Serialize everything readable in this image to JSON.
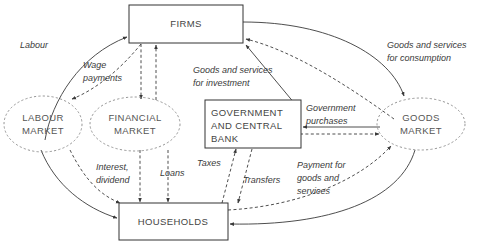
{
  "diagram": {
    "nodes": {
      "firms": {
        "label": "FIRMS",
        "shape": "rectangle"
      },
      "households": {
        "label": "HOUSEHOLDS",
        "shape": "rectangle"
      },
      "government": {
        "label_line1": "GOVERNMENT",
        "label_line2": "AND CENTRAL",
        "label_line3": "BANK",
        "shape": "rectangle"
      },
      "labour_market": {
        "label_line1": "LABOUR",
        "label_line2": "MARKET",
        "shape": "ellipse"
      },
      "financial_market": {
        "label_line1": "FINANCIAL",
        "label_line2": "MARKET",
        "shape": "ellipse"
      },
      "goods_market": {
        "label_line1": "GOODS",
        "label_line2": "MARKET",
        "shape": "ellipse"
      }
    },
    "flows": {
      "labour": {
        "label": "Labour",
        "style": "solid"
      },
      "wage_payments": {
        "label_line1": "Wage",
        "label_line2": "payments",
        "style": "dashed"
      },
      "goods_investment": {
        "label_line1": "Goods and services",
        "label_line2": "for investment",
        "style": "dashed"
      },
      "goods_consumption": {
        "label_line1": "Goods and services",
        "label_line2": "for consumption",
        "style": "solid"
      },
      "government_purchases": {
        "label_line1": "Government",
        "label_line2": "purchases",
        "style": "solid"
      },
      "interest_dividend": {
        "label_line1": "Interest,",
        "label_line2": "dividend",
        "style": "dashed"
      },
      "loans": {
        "label": "Loans",
        "style": "dashed"
      },
      "taxes": {
        "label": "Taxes",
        "style": "dashed"
      },
      "transfers": {
        "label": "Transfers",
        "style": "dashed"
      },
      "payment_goods": {
        "label_line1": "Payment for",
        "label_line2": "goods and",
        "label_line3": "services",
        "style": "dashed"
      }
    },
    "colors": {
      "box_stroke": "#333333",
      "ellipse_stroke": "#8a8a8a",
      "flow_stroke": "#3a3a3a",
      "label_text": "#3a3a3a",
      "node_text": "#555555",
      "background": "#ffffff"
    }
  }
}
